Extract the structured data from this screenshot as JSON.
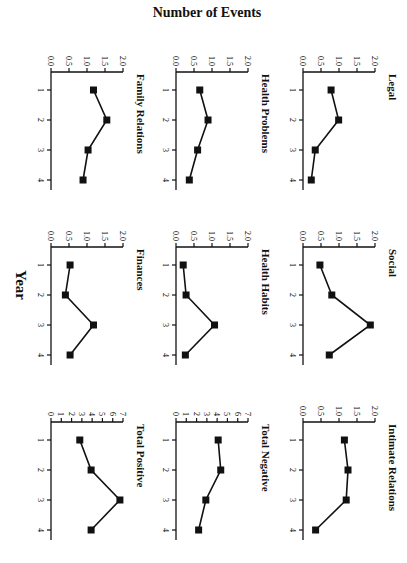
{
  "figure": {
    "y_axis_label": "Number of Events",
    "x_axis_label": "Year",
    "orientation_note_visible": "rotated 90 degrees"
  },
  "chart_data": [
    {
      "type": "line",
      "title": "Legal",
      "x": [
        1,
        2,
        3,
        4
      ],
      "values": [
        0.78,
        0.99,
        0.34,
        0.23
      ],
      "ylim": [
        0,
        2.0
      ],
      "yticks": [
        "0.0",
        "0.5",
        "1.0",
        "1.5",
        "2.0"
      ],
      "xticks": [
        "1",
        "2",
        "3",
        "4"
      ],
      "xlabel": "Year",
      "ylabel": "Number of Events",
      "grid": false
    },
    {
      "type": "line",
      "title": "Social",
      "x": [
        1,
        2,
        3,
        4
      ],
      "values": [
        0.47,
        0.8,
        1.87,
        0.73
      ],
      "ylim": [
        0,
        2.0
      ],
      "yticks": [
        "0.0",
        "0.5",
        "1.0",
        "1.5",
        "2.0"
      ],
      "xticks": [
        "1",
        "2",
        "3",
        "4"
      ],
      "xlabel": "Year",
      "ylabel": "Number of Events",
      "grid": false
    },
    {
      "type": "line",
      "title": "Intimate Relations",
      "x": [
        1,
        2,
        3,
        4
      ],
      "values": [
        1.15,
        1.25,
        1.2,
        0.35
      ],
      "ylim": [
        0,
        2.0
      ],
      "yticks": [
        "0.0",
        "0.5",
        "1.0",
        "1.5",
        "2.0"
      ],
      "xticks": [
        "1",
        "2",
        "3",
        "4"
      ],
      "xlabel": "Year",
      "ylabel": "Number of Events",
      "grid": false
    },
    {
      "type": "line",
      "title": "Health Problems",
      "x": [
        1,
        2,
        3,
        4
      ],
      "values": [
        0.66,
        0.89,
        0.6,
        0.37
      ],
      "ylim": [
        0,
        2.0
      ],
      "yticks": [
        "0.0",
        "0.5",
        "1.0",
        "1.5",
        "2.0"
      ],
      "xticks": [
        "1",
        "2",
        "3",
        "4"
      ],
      "xlabel": "Year",
      "ylabel": "Number of Events",
      "grid": false
    },
    {
      "type": "line",
      "title": "Health Habits",
      "x": [
        1,
        2,
        3,
        4
      ],
      "values": [
        0.2,
        0.28,
        1.07,
        0.26
      ],
      "ylim": [
        0,
        2.0
      ],
      "yticks": [
        "0.0",
        "0.5",
        "1.0",
        "1.5",
        "2.0"
      ],
      "xticks": [
        "1",
        "2",
        "3",
        "4"
      ],
      "xlabel": "Year",
      "ylabel": "Number of Events",
      "grid": false
    },
    {
      "type": "line",
      "title": "Total Negative",
      "x": [
        1,
        2,
        3,
        4
      ],
      "values": [
        4.1,
        4.35,
        2.9,
        2.2
      ],
      "ylim": [
        0,
        7
      ],
      "yticks": [
        "0",
        "1",
        "2",
        "3",
        "4",
        "5",
        "6",
        "7"
      ],
      "xticks": [
        "1",
        "2",
        "3",
        "4"
      ],
      "xlabel": "Year",
      "ylabel": "Number of Events",
      "grid": false
    },
    {
      "type": "line",
      "title": "Family Relations",
      "x": [
        1,
        2,
        3,
        4
      ],
      "values": [
        1.18,
        1.55,
        1.03,
        0.89
      ],
      "ylim": [
        0,
        2.0
      ],
      "yticks": [
        "0.0",
        "0.5",
        "1.0",
        "1.5",
        "2.0"
      ],
      "xticks": [
        "1",
        "2",
        "3",
        "4"
      ],
      "xlabel": "Year",
      "ylabel": "Number of Events",
      "grid": false
    },
    {
      "type": "line",
      "title": "Finances",
      "x": [
        1,
        2,
        3,
        4
      ],
      "values": [
        0.53,
        0.4,
        1.18,
        0.53
      ],
      "ylim": [
        0,
        2.0
      ],
      "yticks": [
        "0.0",
        "0.5",
        "1.0",
        "1.5",
        "2.0"
      ],
      "xticks": [
        "1",
        "2",
        "3",
        "4"
      ],
      "xlabel": "Year",
      "ylabel": "Number of Events",
      "grid": false
    },
    {
      "type": "line",
      "title": "Total Positive",
      "x": [
        1,
        2,
        3,
        4
      ],
      "values": [
        2.8,
        3.9,
        6.7,
        3.9
      ],
      "ylim": [
        0,
        7
      ],
      "yticks": [
        "0",
        "1",
        "2",
        "3",
        "4",
        "5",
        "6",
        "7"
      ],
      "xticks": [
        "1",
        "2",
        "3",
        "4"
      ],
      "xlabel": "Year",
      "ylabel": "Number of Events",
      "grid": false
    }
  ]
}
